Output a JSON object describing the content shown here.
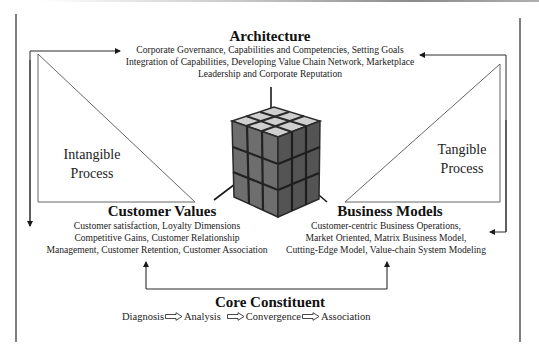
{
  "architecture": {
    "title": "Architecture",
    "lines": [
      "Corporate Governance, Capabilities and Competencies, Setting Goals",
      "Integration of Capabilities, Developing Value Chain Network, Marketplace",
      "Leadership and Corporate Reputation"
    ]
  },
  "intangible": {
    "line1": "Intangible",
    "line2": "Process"
  },
  "tangible": {
    "line1": "Tangible",
    "line2": "Process"
  },
  "customer_values": {
    "title": "Customer Values",
    "lines": [
      "Customer satisfaction, Loyalty Dimensions",
      "Competitive Gains, Customer Relationship",
      "Management, Customer Retention, Customer Association"
    ]
  },
  "business_models": {
    "title": "Business Models",
    "lines": [
      "Customer-centric Business Operations,",
      "Market Oriented, Matrix Business Model,",
      "Cutting-Edge Model, Value-chain System Modeling"
    ]
  },
  "core": {
    "title": "Core Constituent",
    "steps": [
      "Diagnosis",
      "Analysis",
      "Convergence",
      "Association"
    ]
  },
  "center_image": {
    "icon": "rubiks-cube-icon"
  },
  "colors": {
    "line": "#2a2a2a",
    "triangle": "#555555",
    "cube_dark": "#3a3a3a",
    "cube_light": "#bdbdbd"
  }
}
